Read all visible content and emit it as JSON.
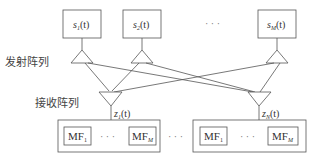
{
  "labels": {
    "tx_array": "发射阵列",
    "rx_array": "接收阵列"
  },
  "transmit_signals": [
    {
      "base": "s",
      "sub": "1",
      "arg": "(t)"
    },
    {
      "base": "s",
      "sub": "2",
      "arg": "(t)"
    },
    {
      "base": "s",
      "sub": "M",
      "arg": "(t)"
    }
  ],
  "tx_ellipsis": "· · ·",
  "receive_signals": [
    {
      "base": "z",
      "sub": "1",
      "arg": "(t)"
    },
    {
      "base": "z",
      "sub": "N",
      "arg": "(t)"
    }
  ],
  "matched_filter_banks": [
    {
      "filters": [
        {
          "base": "MF",
          "sub": "1"
        },
        {
          "base": "MF",
          "sub": "M"
        }
      ],
      "ellipsis": "· · ·"
    },
    {
      "filters": [
        {
          "base": "MF",
          "sub": "1"
        },
        {
          "base": "MF",
          "sub": "M"
        }
      ],
      "ellipsis": "· · ·"
    }
  ],
  "bank_ellipsis": "· · ·"
}
